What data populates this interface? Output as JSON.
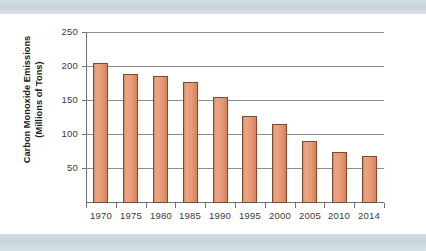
{
  "chart_data": {
    "type": "bar",
    "title": "",
    "xlabel": "",
    "ylabel_lines": [
      "Carbon Monoxide Emissions",
      "(Millions of Tons)"
    ],
    "ylabel": "Carbon Monoxide Emissions (Millions of Tons)",
    "categories": [
      "1970",
      "1975",
      "1980",
      "1985",
      "1990",
      "1995",
      "2000",
      "2005",
      "2010",
      "2014"
    ],
    "values": [
      204,
      188,
      185,
      177,
      154,
      127,
      115,
      89,
      74,
      67
    ],
    "ylim": [
      0,
      250
    ],
    "ytick_labels": [
      "250",
      "200",
      "150",
      "100",
      "50"
    ],
    "ytick_values": [
      250,
      200,
      150,
      100,
      50
    ],
    "grid": true,
    "legend": "none",
    "bar_color": "#e79a77",
    "bar_edge_color": "#7d4a32",
    "grid_color": "#8d8d8d",
    "axis_color": "#6f6f6f",
    "band_color": "#c6d4da",
    "background": "#ffffff"
  }
}
